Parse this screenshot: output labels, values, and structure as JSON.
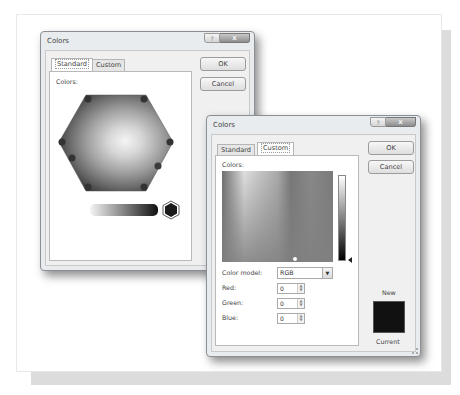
{
  "back_dialog": {
    "title": "Colors",
    "help_icon": "?",
    "close_icon": "x",
    "tabs": [
      {
        "label": "Standard",
        "active": true
      },
      {
        "label": "Custom",
        "active": false
      }
    ],
    "colors_label": "Colors:",
    "ok_label": "OK",
    "cancel_label": "Cancel",
    "selected_swatch_color": "#1a1a1a"
  },
  "front_dialog": {
    "title": "Colors",
    "help_icon": "?",
    "close_icon": "x",
    "tabs": [
      {
        "label": "Standard",
        "active": false
      },
      {
        "label": "Custom",
        "active": true
      }
    ],
    "colors_label": "Colors:",
    "ok_label": "OK",
    "cancel_label": "Cancel",
    "color_model_label": "Color model:",
    "color_model_value": "RGB",
    "fields": [
      {
        "label": "Red:",
        "value": "0"
      },
      {
        "label": "Green:",
        "value": "0"
      },
      {
        "label": "Blue:",
        "value": "0"
      }
    ],
    "new_label": "New",
    "current_label": "Current",
    "swatch_color": "#111111"
  }
}
